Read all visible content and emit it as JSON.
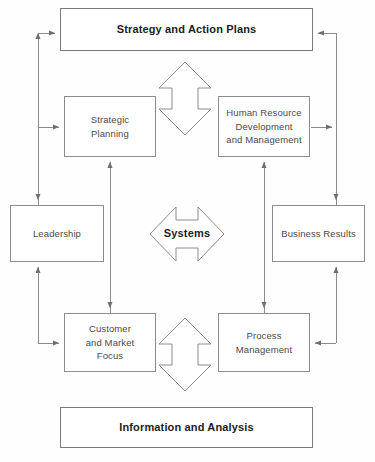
{
  "diagram": {
    "stroke_color": "#8c8c8c",
    "band_stroke_color": "#7a7a7a",
    "text_color": "#4a4a4a",
    "heading_color": "#1d1d1d",
    "background": "#ffffff",
    "nodes": {
      "strategy": {
        "label": "Strategy and Action Plans"
      },
      "strategic_planning": {
        "label": "Strategic\nPlanning"
      },
      "human_resource": {
        "label": "Human Resource\nDevelopment\nand Management"
      },
      "leadership": {
        "label": "Leadership"
      },
      "business_results": {
        "label": "Business Results"
      },
      "customer_market": {
        "label": "Customer\nand Market\nFocus"
      },
      "process_management": {
        "label": "Process\nManagement"
      },
      "information": {
        "label": "Information and Analysis"
      }
    },
    "connectors": {
      "systems_label": "Systems",
      "top_arrow": "vertical-double-arrow",
      "bottom_arrow": "vertical-double-arrow",
      "center_arrow": "horizontal-double-arrow"
    }
  }
}
